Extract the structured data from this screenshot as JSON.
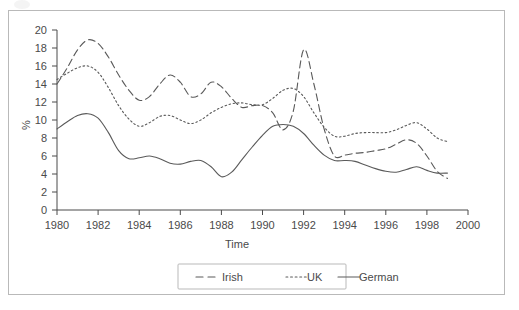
{
  "chart_data": {
    "type": "line",
    "title": "",
    "xlabel": "Time",
    "ylabel": "%",
    "xlim": [
      1980,
      2000
    ],
    "ylim": [
      0,
      20
    ],
    "xticks": [
      1980,
      1982,
      1984,
      1986,
      1988,
      1990,
      1992,
      1994,
      1996,
      1998,
      2000
    ],
    "yticks": [
      0,
      2,
      4,
      6,
      8,
      10,
      12,
      14,
      16,
      18,
      20
    ],
    "xtick_labels": [
      "1980",
      "1982",
      "1984",
      "1986",
      "1988",
      "1990",
      "1992",
      "1994",
      "1996",
      "1998",
      "2000"
    ],
    "ytick_labels": [
      "0",
      "2",
      "4",
      "6",
      "8",
      "10",
      "12",
      "14",
      "16",
      "18",
      "20"
    ],
    "grid": false,
    "legend_position": "bottom-center",
    "x": [
      1980,
      1980.5,
      1981,
      1981.5,
      1982,
      1982.5,
      1983,
      1983.5,
      1984,
      1984.5,
      1985,
      1985.5,
      1986,
      1986.5,
      1987,
      1987.5,
      1988,
      1988.5,
      1989,
      1989.5,
      1990,
      1990.5,
      1991,
      1991.5,
      1992,
      1992.5,
      1993,
      1993.5,
      1994,
      1994.5,
      1995,
      1995.5,
      1996,
      1996.5,
      1997,
      1997.5,
      1998,
      1998.5,
      1999
    ],
    "series": [
      {
        "name": "Irish",
        "style": "dashed",
        "color": "#5a5a5a",
        "values": [
          14.0,
          15.8,
          17.8,
          18.9,
          18.5,
          17.0,
          15.0,
          13.3,
          12.2,
          12.6,
          14.0,
          15.0,
          14.2,
          12.6,
          12.9,
          14.2,
          13.7,
          12.4,
          11.4,
          11.6,
          11.6,
          10.8,
          8.9,
          11.0,
          17.8,
          14.0,
          9.0,
          6.0,
          6.1,
          6.3,
          6.4,
          6.6,
          6.8,
          7.3,
          7.8,
          7.4,
          6.0,
          4.3,
          3.5
        ]
      },
      {
        "name": "UK",
        "style": "dotted",
        "color": "#5a5a5a",
        "values": [
          14.5,
          15.2,
          15.8,
          16.0,
          15.3,
          13.6,
          11.6,
          10.1,
          9.3,
          9.7,
          10.4,
          10.5,
          10.0,
          9.6,
          10.0,
          10.8,
          11.4,
          11.8,
          11.9,
          11.7,
          11.7,
          12.4,
          13.3,
          13.5,
          12.6,
          10.8,
          9.2,
          8.2,
          8.2,
          8.5,
          8.6,
          8.6,
          8.6,
          8.9,
          9.4,
          9.7,
          9.0,
          8.0,
          7.6
        ]
      },
      {
        "name": "German",
        "style": "solid",
        "color": "#5a5a5a",
        "values": [
          9.0,
          9.8,
          10.5,
          10.7,
          10.2,
          8.6,
          6.6,
          5.7,
          5.8,
          6.0,
          5.7,
          5.2,
          5.1,
          5.4,
          5.5,
          4.8,
          3.7,
          4.2,
          5.6,
          7.0,
          8.3,
          9.3,
          9.5,
          9.3,
          8.5,
          7.2,
          6.1,
          5.5,
          5.5,
          5.4,
          5.0,
          4.6,
          4.3,
          4.2,
          4.5,
          4.8,
          4.4,
          4.1,
          4.1
        ]
      }
    ],
    "legend": [
      {
        "label": "Irish",
        "style": "dashed"
      },
      {
        "label": "UK",
        "style": "dotted"
      },
      {
        "label": "German",
        "style": "solid"
      }
    ]
  }
}
